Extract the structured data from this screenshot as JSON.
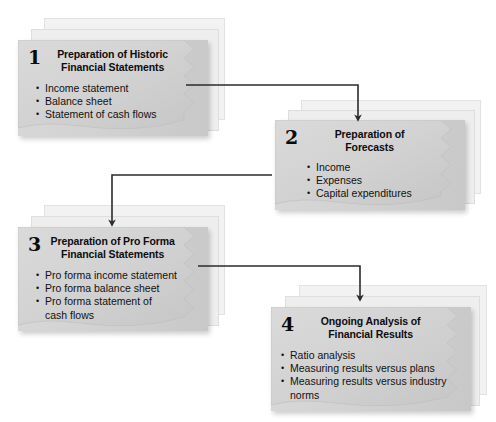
{
  "diagram": {
    "style": {
      "page_background": "#ffffff",
      "front_sheet_fill": "#d2d2d2",
      "back_sheet_fill": "#f2f2f2",
      "text_color": "#111111",
      "connector_color": "#2b2b2b"
    },
    "steps": [
      {
        "number": "1",
        "title": "Preparation of Historic\nFinancial Statements",
        "bullets": [
          "Income statement",
          "Balance sheet",
          "Statement of cash flows"
        ]
      },
      {
        "number": "2",
        "title": "Preparation of\nForecasts",
        "bullets": [
          "Income",
          "Expenses",
          "Capital expenditures"
        ]
      },
      {
        "number": "3",
        "title": "Preparation of Pro Forma\nFinancial Statements",
        "bullets": [
          "Pro forma income statement",
          "Pro forma balance sheet",
          "Pro forma statement of\ncash flows"
        ]
      },
      {
        "number": "4",
        "title": "Ongoing Analysis of\nFinancial Results",
        "bullets": [
          "Ratio analysis",
          "Measuring results versus plans",
          "Measuring results versus industry\nnorms"
        ]
      }
    ],
    "connectors": [
      {
        "from": "1",
        "to": "2"
      },
      {
        "from": "2",
        "to": "3"
      },
      {
        "from": "3",
        "to": "4"
      }
    ]
  }
}
